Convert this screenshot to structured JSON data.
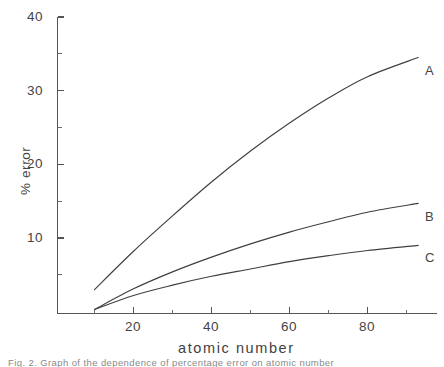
{
  "chart_data": {
    "type": "line",
    "title": "",
    "xlabel": "atomic number",
    "ylabel": "% error",
    "xlim": [
      0,
      100
    ],
    "ylim": [
      0,
      40
    ],
    "grid": false,
    "legend_position": "inline-right-of-curve-ends",
    "x_ticks": [
      20,
      40,
      60,
      80
    ],
    "x_tick_labels": [
      "20",
      "40",
      "60",
      "80"
    ],
    "x_minor_ticks": [
      10,
      30,
      50,
      70,
      90
    ],
    "y_ticks": [
      10,
      20,
      30,
      40
    ],
    "y_tick_labels": [
      "10",
      "20",
      "30",
      "40"
    ],
    "y_minor_ticks": [
      5,
      15,
      25,
      35
    ],
    "series": [
      {
        "name": "A",
        "label": "A",
        "x": [
          10,
          20,
          30,
          40,
          50,
          60,
          70,
          80,
          93
        ],
        "values": [
          3.0,
          8.2,
          13.0,
          17.6,
          21.8,
          25.6,
          29.0,
          31.9,
          34.5
        ]
      },
      {
        "name": "B",
        "label": "B",
        "x": [
          10,
          20,
          30,
          40,
          50,
          60,
          70,
          80,
          93
        ],
        "values": [
          0.3,
          3.1,
          5.4,
          7.4,
          9.2,
          10.8,
          12.2,
          13.5,
          14.7
        ]
      },
      {
        "name": "C",
        "label": "C",
        "x": [
          10,
          20,
          30,
          40,
          50,
          60,
          70,
          80,
          93
        ],
        "values": [
          0.3,
          2.2,
          3.6,
          4.8,
          5.8,
          6.8,
          7.6,
          8.3,
          9.0
        ]
      }
    ]
  },
  "axes": {
    "x_title": "atomic number",
    "y_title": "% error"
  },
  "curve_labels": {
    "a": "A",
    "b": "B",
    "c": "C"
  },
  "caption": {
    "text": "Fig. 2. Graph of the dependence of percentage error on atomic number"
  },
  "colors": {
    "line": "#3f3f3f",
    "axis": "#555555",
    "text": "#454545",
    "background": "#ffffff"
  }
}
